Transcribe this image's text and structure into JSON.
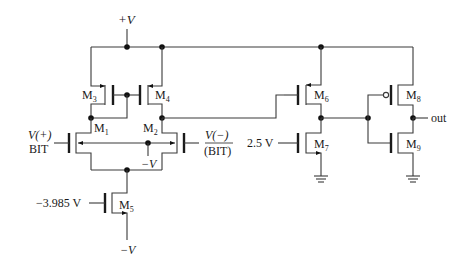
{
  "diagram": {
    "type": "circuit-schematic",
    "title": "",
    "supply": {
      "positive_label": "+V",
      "negative_label": "−V"
    },
    "transistors": [
      {
        "id": "M3",
        "label": "M",
        "sub": "3",
        "type": "pmos"
      },
      {
        "id": "M4",
        "label": "M",
        "sub": "4",
        "type": "pmos"
      },
      {
        "id": "M1",
        "label": "M",
        "sub": "1",
        "type": "nmos"
      },
      {
        "id": "M2",
        "label": "M",
        "sub": "2",
        "type": "nmos"
      },
      {
        "id": "M5",
        "label": "M",
        "sub": "5",
        "type": "nmos"
      },
      {
        "id": "M6",
        "label": "M",
        "sub": "6",
        "type": "pmos"
      },
      {
        "id": "M7",
        "label": "M",
        "sub": "7",
        "type": "nmos"
      },
      {
        "id": "M8",
        "label": "M",
        "sub": "8",
        "type": "pmos"
      },
      {
        "id": "M9",
        "label": "M",
        "sub": "9",
        "type": "nmos"
      }
    ],
    "inputs": {
      "left_line1": "V(+)",
      "left_line2": "BIT",
      "right_line1": "V(−)",
      "right_line2": "(BIT)",
      "bias_m5": "−3.985 V",
      "bias_m7": "2.5 V"
    },
    "body_bias_label": "−V",
    "bottom_supply_label": "−V",
    "output_label": "out",
    "colors": {
      "wire": "#3a3a3a",
      "node": "#111111",
      "background": "#ffffff"
    }
  }
}
